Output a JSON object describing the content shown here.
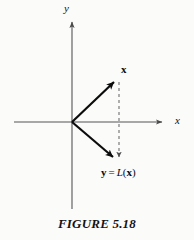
{
  "figure": {
    "caption": "FIGURE 5.18",
    "background_color": "#fbfbfa",
    "ink_color": "#101010"
  },
  "axes": {
    "x_label": "x",
    "y_label": "y",
    "origin": {
      "x": 72,
      "y": 122
    },
    "x_axis": {
      "x1": 14,
      "y1": 122,
      "x2": 166,
      "y2": 122,
      "arrow": "right"
    },
    "y_axis": {
      "x1": 72,
      "y1": 209,
      "x2": 72,
      "y2": 18,
      "arrow": "up"
    },
    "color": "#555555"
  },
  "vectors": [
    {
      "name": "x",
      "label_html": "x",
      "label_style": "bold",
      "from": {
        "x": 72,
        "y": 122
      },
      "to": {
        "x": 117,
        "y": 79
      },
      "stroke_width": 2.2,
      "color": "#0c0c0c"
    },
    {
      "name": "y",
      "label_parts": {
        "lhs": "y",
        "equals": "=",
        "func": "L",
        "open": "(",
        "arg": "x",
        "close": ")"
      },
      "label_text": "y = L(x)",
      "from": {
        "x": 72,
        "y": 122
      },
      "to": {
        "x": 117,
        "y": 160
      },
      "stroke_width": 2.2,
      "color": "#0c0c0c"
    }
  ],
  "dashed_connector": {
    "name": "projection-dashed-line",
    "from": {
      "x": 119,
      "y": 82
    },
    "to": {
      "x": 119,
      "y": 162
    },
    "dash_pattern": "3,3",
    "color": "#6f6f6f",
    "arrow": "down"
  },
  "labels": {
    "vector_x": "x",
    "vector_y_full": "y = L(x)",
    "axis_x": "x",
    "axis_y": "y"
  }
}
